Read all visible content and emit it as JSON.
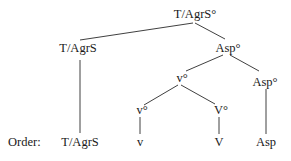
{
  "diagram": {
    "type": "syntax-tree",
    "nodes": {
      "root": "T/AgrS°",
      "t_agrs": "T/AgrS",
      "asp_bar": "Asp°",
      "v_little_head": "v°",
      "asp_head": "Asp°",
      "v_little": "v°",
      "V_big": "V°"
    },
    "order_row": {
      "label": "Order:",
      "items": [
        "T/AgrS",
        "v",
        "V",
        "Asp"
      ]
    },
    "edges": [
      [
        "root",
        "t_agrs"
      ],
      [
        "root",
        "asp_bar"
      ],
      [
        "asp_bar",
        "v_little_head"
      ],
      [
        "asp_bar",
        "asp_head"
      ],
      [
        "v_little_head",
        "v_little"
      ],
      [
        "v_little_head",
        "V_big"
      ],
      [
        "t_agrs",
        "order.T/AgrS"
      ],
      [
        "v_little",
        "order.v"
      ],
      [
        "V_big",
        "order.V"
      ],
      [
        "asp_head",
        "order.Asp"
      ]
    ]
  }
}
